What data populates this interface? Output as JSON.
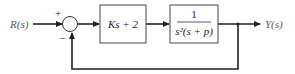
{
  "diagram": {
    "type": "feedback-block-diagram",
    "input_label": "R(s)",
    "output_label": "Y(s)",
    "summing_junction": {
      "plus_sign": "+",
      "minus_sign": "−"
    },
    "blocks": [
      {
        "id": "controller",
        "label": "Ks + 2"
      },
      {
        "id": "plant",
        "numerator": "1",
        "denominator": "s²(s + p)"
      }
    ],
    "feedback": "unity negative feedback",
    "colors": {
      "line": "#222222",
      "block_border": "#444444",
      "text": "#555555"
    }
  }
}
